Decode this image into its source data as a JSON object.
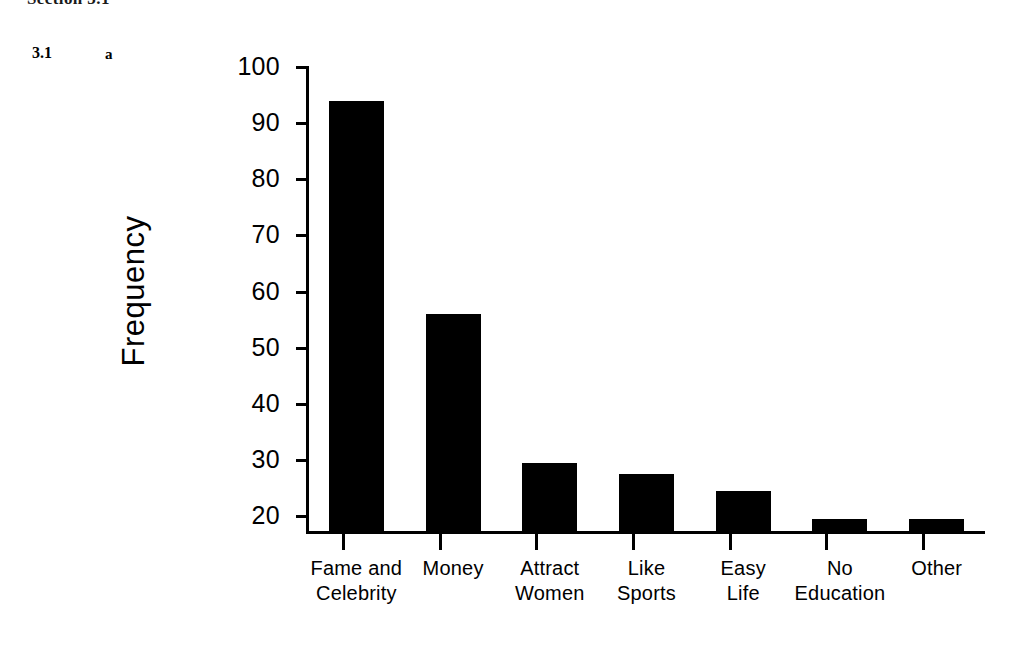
{
  "page": {
    "running_head": "Section 3.1",
    "figure_number": "3.1",
    "panel_letter": "a"
  },
  "chart_data": {
    "type": "bar",
    "title": "",
    "xlabel": "",
    "ylabel": "Frequency",
    "ylim": [
      17,
      100
    ],
    "grid": false,
    "legend": "none",
    "bar_color": "#000000",
    "categories": [
      "Fame and Celebrity",
      "Money",
      "Attract Women",
      "Like Sports",
      "Easy Life",
      "No Education",
      "Other"
    ],
    "category_lines": [
      [
        "Fame and",
        "Celebrity"
      ],
      [
        "Money",
        ""
      ],
      [
        "Attract",
        "Women"
      ],
      [
        "Like",
        "Sports"
      ],
      [
        "Easy",
        "Life"
      ],
      [
        "No",
        "Education"
      ],
      [
        "Other",
        ""
      ]
    ],
    "values": [
      94,
      56,
      29.5,
      27.5,
      24.5,
      19.5,
      19.5
    ],
    "ytick_labels": [
      "100",
      "90",
      "80",
      "70",
      "60",
      "50",
      "40",
      "30",
      "20"
    ],
    "ytick_values": [
      100,
      90,
      80,
      70,
      60,
      50,
      40,
      30,
      20
    ]
  }
}
